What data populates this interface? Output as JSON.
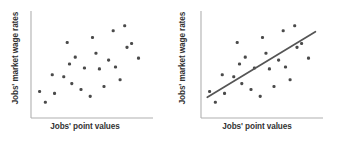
{
  "figure": {
    "background_color": "#ffffff",
    "panels": [
      {
        "id": "scatter-only",
        "xlabel": "Jobs' point values",
        "ylabel": "Jobs' market wage rates",
        "has_trendline": false
      },
      {
        "id": "scatter-with-trendline",
        "xlabel": "Jobs' point values",
        "ylabel": "Jobs' market wage rates",
        "has_trendline": true
      }
    ]
  },
  "style": {
    "axis_color": "#b0b0b0",
    "point_color": "#4a4a4a",
    "trendline_color": "#555555",
    "label_color": "#333333",
    "point_size": 3.1,
    "axis_width": 1.1,
    "trendline_width": 1.7
  },
  "chart_data": {
    "type": "scatter",
    "title": "",
    "xlabel": "Jobs' point values",
    "ylabel": "Jobs' market wage rates",
    "xlim": [
      0,
      100
    ],
    "ylim": [
      0,
      100
    ],
    "grid": false,
    "legend": null,
    "axis_ticks": false,
    "tick_labels": [],
    "series": [
      {
        "name": "jobs",
        "points": [
          [
            4,
            23
          ],
          [
            9,
            12
          ],
          [
            17,
            21
          ],
          [
            15,
            40
          ],
          [
            25,
            38
          ],
          [
            28,
            73
          ],
          [
            30,
            51
          ],
          [
            32,
            31
          ],
          [
            35,
            58
          ],
          [
            40,
            25
          ],
          [
            43,
            47
          ],
          [
            48,
            18
          ],
          [
            50,
            78
          ],
          [
            53,
            62
          ],
          [
            56,
            46
          ],
          [
            60,
            28
          ],
          [
            64,
            55
          ],
          [
            68,
            85
          ],
          [
            70,
            48
          ],
          [
            74,
            35
          ],
          [
            78,
            90
          ],
          [
            80,
            68
          ],
          [
            84,
            72
          ],
          [
            90,
            57
          ]
        ]
      }
    ],
    "trendline": {
      "present_in_panel": "scatter-with-trendline",
      "x_start": 2,
      "y_start": 17,
      "x_end": 96,
      "y_end": 84,
      "type": "linear-regression"
    }
  }
}
